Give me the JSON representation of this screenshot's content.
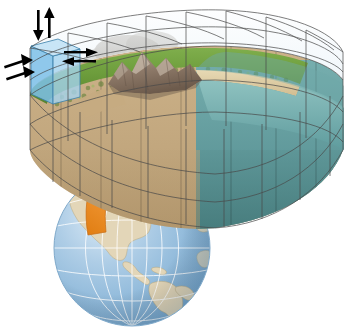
{
  "figure": {
    "caption": ""
  },
  "globe": {
    "name": "earth-globe",
    "region_shown": "Americas",
    "ocean_color": "#9cc3e0",
    "ocean_color_light": "#cfe3f2",
    "land_color": "#e3d6b8",
    "graticule_color": "#ffffff",
    "outline_color": "#7fa9ca",
    "center_x": 132,
    "center_y": 248,
    "radius": 78
  },
  "zoom_arrow": {
    "name": "zoom-connector-arrow",
    "color": "#e8861f",
    "color_dark": "#c96c12",
    "direction": "globe-to-grid"
  },
  "grid_block": {
    "name": "climate-grid-block",
    "columns": 8,
    "wire_color": "#4a4a4a",
    "atmosphere_layers": 3,
    "surface_layers": 1,
    "subsurface_layers": 2
  },
  "layers": [
    {
      "name": "atmosphere",
      "label": "Atmosphere",
      "color": "#eef5fa"
    },
    {
      "name": "clouds",
      "label": "Clouds",
      "color": "#c9c9c7"
    },
    {
      "name": "grassland",
      "label": "Vegetation",
      "color": "#6f9b3e"
    },
    {
      "name": "mountains",
      "label": "Mountains",
      "color": "#9b8570"
    },
    {
      "name": "beach",
      "label": "Coast",
      "color": "#d9c79c"
    },
    {
      "name": "ocean",
      "label": "Ocean",
      "color": "#5f9ea0"
    },
    {
      "name": "soil",
      "label": "Soil",
      "color": "#c2a982"
    }
  ],
  "highlight_cell": {
    "name": "highlighted-grid-cell",
    "fill_top": "#bfe0f4",
    "fill_left": "#7dc0e8",
    "fill_front": "#a5d3ef",
    "edge_color": "#3a7fa8"
  },
  "flux_arrows": {
    "color": "#000000",
    "items": [
      {
        "name": "flux-arrow-down",
        "direction": "down"
      },
      {
        "name": "flux-arrow-up",
        "direction": "up"
      },
      {
        "name": "flux-arrow-right-out",
        "direction": "right"
      },
      {
        "name": "flux-arrow-left-in",
        "direction": "left"
      },
      {
        "name": "flux-arrow-diagonal-in-1",
        "direction": "up-right"
      },
      {
        "name": "flux-arrow-diagonal-in-2",
        "direction": "up-right"
      }
    ]
  }
}
